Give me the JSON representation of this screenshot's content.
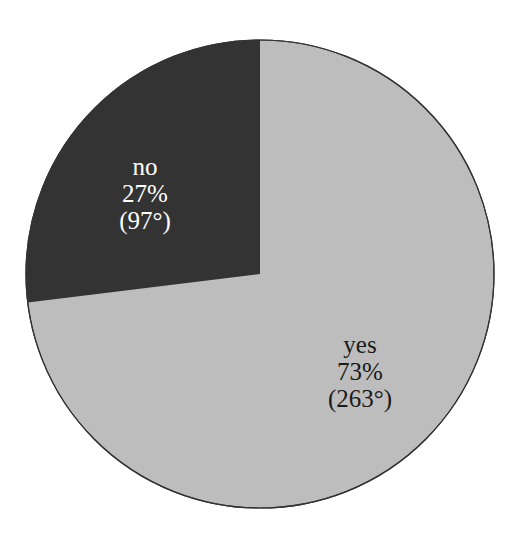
{
  "chart_data": {
    "type": "pie",
    "title": "",
    "categories": [
      "no",
      "yes"
    ],
    "values": [
      27,
      73
    ],
    "degrees": [
      97,
      263
    ],
    "colors": [
      "#333333",
      "#bdbdbd"
    ],
    "labels": [
      {
        "name": "no",
        "percent": "27%",
        "degrees": "(97°)",
        "text_color": "#ffffff"
      },
      {
        "name": "yes",
        "percent": "73%",
        "degrees": "(263°)",
        "text_color": "#1a1a1a"
      }
    ],
    "start_angle_deg": 0,
    "direction": "counterclockwise",
    "legend": "none"
  }
}
